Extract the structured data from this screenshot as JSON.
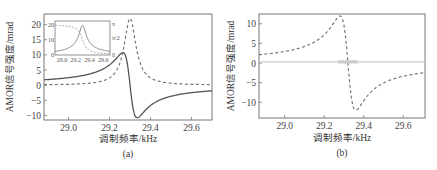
{
  "chart_data": [
    {
      "id": "a",
      "type": "line",
      "caption": "(a)",
      "xlabel": "调制频率/kHz",
      "ylabel": "AMOR信号强度/mrad",
      "xlim": [
        28.88,
        29.7
      ],
      "ylim": [
        -11.5,
        23.5
      ],
      "xticks": [
        29.0,
        29.2,
        29.4,
        29.6
      ],
      "xtick_labels": [
        "29.0",
        "29.2",
        "29.4",
        "29.6"
      ],
      "yticks": [
        20,
        15,
        10,
        5,
        0,
        -5,
        -10
      ],
      "ytick_labels": [
        "20",
        "15",
        "10",
        "5",
        "0",
        "-5",
        "-10"
      ],
      "grid": false,
      "resonance": {
        "center": 29.3,
        "half_width": 0.035
      },
      "series": [
        {
          "name": "dispersion (solid)",
          "style": "solid",
          "x": [
            28.88,
            29.0,
            29.1,
            29.2,
            29.25,
            29.27,
            29.3,
            29.33,
            29.35,
            29.4,
            29.5,
            29.6,
            29.7
          ],
          "values": [
            -2.5,
            -3.2,
            -4.3,
            -7.5,
            -10.5,
            -9.5,
            0.5,
            10.5,
            10.0,
            7.5,
            4.5,
            3.0,
            2.3
          ]
        },
        {
          "name": "absorption (dashed)",
          "style": "dashed",
          "x": [
            28.88,
            29.0,
            29.1,
            29.2,
            29.25,
            29.28,
            29.3,
            29.32,
            29.35,
            29.4,
            29.5,
            29.6,
            29.7
          ],
          "values": [
            0.2,
            0.4,
            0.9,
            3.0,
            8.0,
            16.0,
            22.0,
            18.0,
            9.0,
            3.5,
            1.0,
            0.4,
            0.2
          ]
        }
      ],
      "inset": {
        "xlim": [
          28.9,
          29.7
        ],
        "xtick_labels": [
          "29.0",
          "29.2",
          "29.4",
          "29.6"
        ],
        "xticks": [
          29.0,
          29.2,
          29.4,
          29.6
        ],
        "left_yticks": [
          0,
          10,
          20
        ],
        "left_ytick_labels": [
          "0",
          "10",
          "20"
        ],
        "right_ytick_labels": [
          "0",
          "π/2",
          "π"
        ],
        "series": [
          {
            "name": "amplitude (solid)",
            "style": "solid",
            "peak": 20,
            "center": 29.3
          },
          {
            "name": "phase (dashed)",
            "style": "dashed",
            "range": [
              3.14,
              0
            ]
          }
        ]
      }
    },
    {
      "id": "b",
      "type": "line",
      "caption": "(b)",
      "xlabel": "调制频率/kHz",
      "ylabel": "AMOR信号强度/mrad",
      "xlim": [
        28.87,
        29.71
      ],
      "ylim": [
        -14,
        12.5
      ],
      "xticks": [
        29.0,
        29.2,
        29.4,
        29.6
      ],
      "xtick_labels": [
        "29.0",
        "29.2",
        "29.4",
        "29.6"
      ],
      "yticks": [
        10,
        5,
        0,
        -5,
        -10
      ],
      "ytick_labels": [
        "10",
        "5",
        "0",
        "-5",
        "-10"
      ],
      "grid": false,
      "resonance": {
        "center": 29.32,
        "half_width": 0.04
      },
      "series": [
        {
          "name": "dispersion (dashed)",
          "style": "dashed",
          "x": [
            28.87,
            29.0,
            29.1,
            29.2,
            29.25,
            29.28,
            29.32,
            29.36,
            29.4,
            29.5,
            29.6,
            29.71
          ],
          "values": [
            -2.0,
            -2.6,
            -3.6,
            -6.5,
            -10.0,
            -12.8,
            0.0,
            11.2,
            9.0,
            5.5,
            4.0,
            3.2
          ]
        },
        {
          "name": "baseline (light solid)",
          "style": "solid-light",
          "x": [
            28.87,
            29.71
          ],
          "values": [
            0.3,
            0.3
          ]
        }
      ]
    }
  ]
}
